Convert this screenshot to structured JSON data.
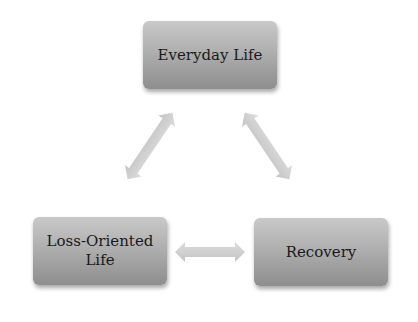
{
  "diagram": {
    "type": "cycle",
    "nodes": [
      {
        "id": "top",
        "label": "Everyday Life"
      },
      {
        "id": "left",
        "label": "Loss-Oriented Life"
      },
      {
        "id": "right",
        "label": "Recovery"
      }
    ],
    "edges": [
      {
        "from": "top",
        "to": "left",
        "style": "double-arrow"
      },
      {
        "from": "top",
        "to": "right",
        "style": "double-arrow"
      },
      {
        "from": "left",
        "to": "right",
        "style": "double-arrow"
      }
    ],
    "colors": {
      "node_fill": "#a9a9a9",
      "arrow_fill": "#cfcfcf",
      "text": "#1a1a1a"
    }
  }
}
